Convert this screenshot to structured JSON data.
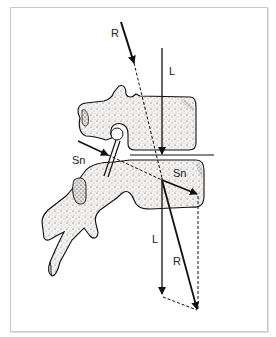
{
  "figure": {
    "labels": {
      "r_top": "R",
      "l_top": "L",
      "sn_left": "Sn",
      "sn_right": "Sn",
      "l_bottom": "L",
      "r_bottom": "R"
    },
    "colors": {
      "line": "#111111",
      "bone_fill": "#f1f0ee",
      "bone_stipple": "#555555",
      "frame": "#cfc6c8"
    }
  }
}
